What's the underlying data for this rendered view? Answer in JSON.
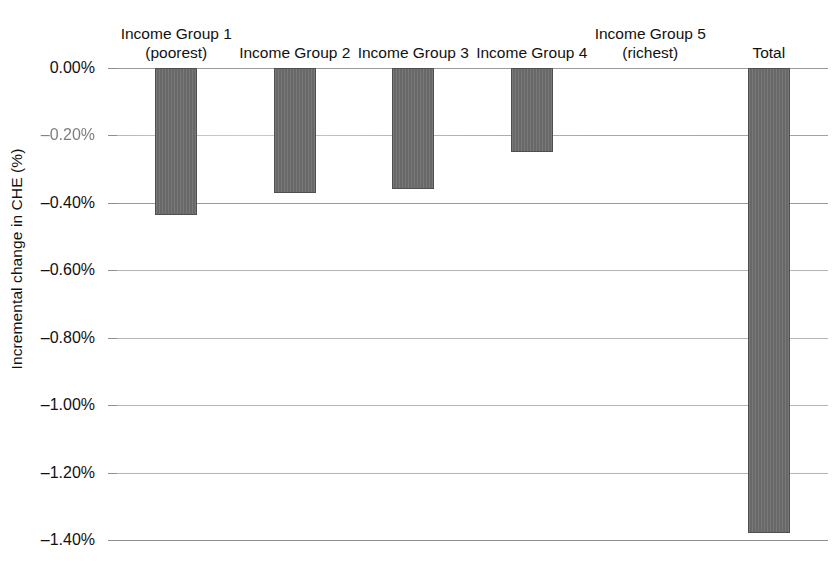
{
  "chart_data": {
    "type": "bar",
    "title": "",
    "xlabel": "",
    "ylabel": "Incremental change in CHE (%)",
    "categories": [
      "Income Group 1 (poorest)",
      "Income Group 2",
      "Income Group 3",
      "Income Group 4",
      "Income Group 5 (richest)",
      "Total"
    ],
    "values": [
      -0.435,
      -0.37,
      -0.36,
      -0.25,
      0.0,
      -1.38
    ],
    "ylim": [
      -1.4,
      0.0
    ],
    "ytick_labels": [
      "0.00%",
      "–0.20%",
      "–0.40%",
      "–0.60%",
      "–0.80%",
      "–1.00%",
      "–1.20%",
      "–1.40%"
    ],
    "ytick_values": [
      0.0,
      -0.2,
      -0.4,
      -0.6,
      -0.8,
      -1.0,
      -1.2,
      -1.4
    ],
    "grid": true,
    "legend": "none",
    "bar_color": "#6e6e6e",
    "bar_border_color": "#4f4f4f",
    "gridline_color": "#9a9a9a"
  },
  "axis": {
    "y_title": "Incremental change in CHE (%)",
    "ticks": [
      {
        "label": "0.00%",
        "value": 0.0
      },
      {
        "label": "–0.20%",
        "value": -0.2,
        "degraded": true
      },
      {
        "label": "–0.40%",
        "value": -0.4
      },
      {
        "label": "–0.60%",
        "value": -0.6
      },
      {
        "label": "–0.80%",
        "value": -0.8
      },
      {
        "label": "–1.00%",
        "value": -1.0
      },
      {
        "label": "–1.20%",
        "value": -1.2
      },
      {
        "label": "–1.40%",
        "value": -1.4
      }
    ]
  },
  "categories": [
    {
      "line1": "Income Group 1",
      "line2": "(poorest)",
      "value": -0.435
    },
    {
      "line1": "Income Group 2",
      "line2": "",
      "value": -0.37
    },
    {
      "line1": "Income Group 3",
      "line2": "",
      "value": -0.36
    },
    {
      "line1": "Income Group 4",
      "line2": "",
      "value": -0.25
    },
    {
      "line1": "Income Group 5",
      "line2": "(richest)",
      "value": 0.0
    },
    {
      "line1": "Total",
      "line2": "",
      "value": -1.38
    }
  ]
}
